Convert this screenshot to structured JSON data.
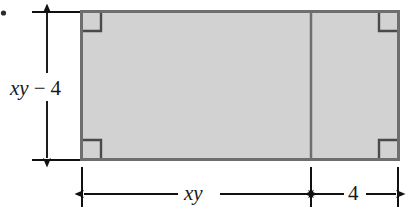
{
  "figure": {
    "type": "geometry-diagram",
    "shape": {
      "name": "rectangle",
      "fill_color": "#d2d2d2",
      "stroke_color": "#666666",
      "right_angle_marks": 4
    },
    "divider": {
      "name": "vertical-divider",
      "orientation": "vertical"
    },
    "dimensions": {
      "height": {
        "label_parts": {
          "variable": "xy",
          "operator": "−",
          "number": "4"
        },
        "label_text": "xy − 4",
        "position": "left",
        "arrow_style": "double-headed"
      },
      "width_left": {
        "label_text": "xy",
        "position": "bottom",
        "arrow_style": "double-headed"
      },
      "width_right": {
        "label_text": "4",
        "position": "bottom",
        "arrow_style": "double-headed"
      }
    },
    "marker": {
      "name": "item-bullet",
      "shape": "dot"
    }
  }
}
